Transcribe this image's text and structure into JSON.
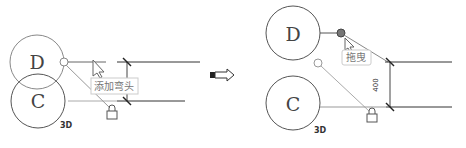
{
  "left": {
    "grid_top": "D",
    "grid_bottom": "C",
    "level_tag": "3D",
    "tooltip": "添加弯头"
  },
  "transition_arrow": "⇨",
  "right": {
    "grid_top": "D",
    "grid_bottom": "C",
    "level_tag": "3D",
    "tooltip": "拖曳",
    "dimension": "400"
  },
  "colors": {
    "line_dark": "#333333",
    "line_light": "#9a9a9a",
    "tooltip_border": "#c8c8c8"
  }
}
